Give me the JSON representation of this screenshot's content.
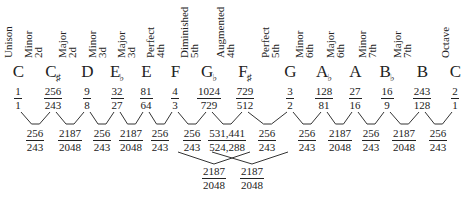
{
  "intervals": [
    {
      "name_line1": "Unison",
      "name_line2": "",
      "note": "C",
      "accidental": "",
      "ratio_num": "1",
      "ratio_den": "1",
      "x": 18
    },
    {
      "name_line1": "Minor",
      "name_line2": "2d",
      "note": "C",
      "accidental": "♯",
      "ratio_num": "256",
      "ratio_den": "243",
      "x": 53
    },
    {
      "name_line1": "Major",
      "name_line2": "2d",
      "note": "D",
      "accidental": "",
      "ratio_num": "9",
      "ratio_den": "8",
      "x": 87
    },
    {
      "name_line1": "Minor",
      "name_line2": "3d",
      "note": "E",
      "accidental": "♭",
      "ratio_num": "32",
      "ratio_den": "27",
      "x": 117
    },
    {
      "name_line1": "Major",
      "name_line2": "3d",
      "note": "E",
      "accidental": "",
      "ratio_num": "81",
      "ratio_den": "64",
      "x": 146
    },
    {
      "name_line1": "Perfect",
      "name_line2": "4th",
      "note": "F",
      "accidental": "",
      "ratio_num": "4",
      "ratio_den": "3",
      "x": 175
    },
    {
      "name_line1": "Diminished",
      "name_line2": "5th",
      "note": "G",
      "accidental": "♭",
      "ratio_num": "1024",
      "ratio_den": "729",
      "x": 209
    },
    {
      "name_line1": "Augmented",
      "name_line2": "4th",
      "note": "F",
      "accidental": "♯",
      "ratio_num": "729",
      "ratio_den": "512",
      "x": 245
    },
    {
      "name_line1": "Perfect",
      "name_line2": "5th",
      "note": "G",
      "accidental": "",
      "ratio_num": "3",
      "ratio_den": "2",
      "x": 290
    },
    {
      "name_line1": "Minor",
      "name_line2": "6th",
      "note": "A",
      "accidental": "♭",
      "ratio_num": "128",
      "ratio_den": "81",
      "x": 324
    },
    {
      "name_line1": "Major",
      "name_line2": "6th",
      "note": "A",
      "accidental": "",
      "ratio_num": "27",
      "ratio_den": "16",
      "x": 355
    },
    {
      "name_line1": "Minor",
      "name_line2": "7th",
      "note": "B",
      "accidental": "♭",
      "ratio_num": "16",
      "ratio_den": "9",
      "x": 387
    },
    {
      "name_line1": "Major",
      "name_line2": "7th",
      "note": "B",
      "accidental": "",
      "ratio_num": "243",
      "ratio_den": "128",
      "x": 422
    },
    {
      "name_line1": "Octave",
      "name_line2": "",
      "note": "C",
      "accidental": "",
      "ratio_num": "2",
      "ratio_den": "1",
      "x": 455
    }
  ],
  "steps": [
    {
      "num": "256",
      "den": "243",
      "x": 35
    },
    {
      "num": "2187",
      "den": "2048",
      "x": 70
    },
    {
      "num": "256",
      "den": "243",
      "x": 102
    },
    {
      "num": "2187",
      "den": "2048",
      "x": 131
    },
    {
      "num": "256",
      "den": "243",
      "x": 160
    },
    {
      "num": "256",
      "den": "243",
      "x": 192
    },
    {
      "num": "531,441",
      "den": "524,288",
      "x": 227
    },
    {
      "num": "256",
      "den": "243",
      "x": 267
    },
    {
      "num": "256",
      "den": "243",
      "x": 307
    },
    {
      "num": "2187",
      "den": "2048",
      "x": 340
    },
    {
      "num": "256",
      "den": "243",
      "x": 371
    },
    {
      "num": "2187",
      "den": "2048",
      "x": 404
    },
    {
      "num": "256",
      "den": "243",
      "x": 438
    }
  ],
  "cross_steps": [
    {
      "num": "2187",
      "den": "2048",
      "x": 214
    },
    {
      "num": "2187",
      "den": "2048",
      "x": 252
    }
  ]
}
